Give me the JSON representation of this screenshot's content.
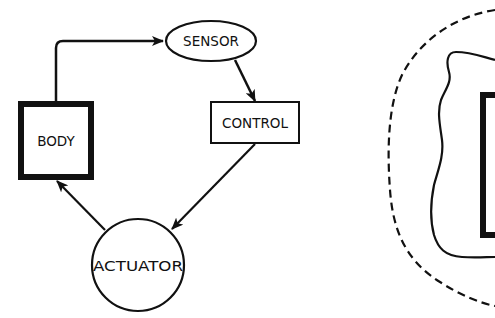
{
  "diagram": {
    "type": "feedback-loop",
    "colors": {
      "stroke": "#111111",
      "background": "#ffffff"
    },
    "nodes": {
      "sensor": {
        "label": "SENSOR",
        "shape": "ellipse"
      },
      "control": {
        "label": "CONTROL",
        "shape": "rectangle"
      },
      "actuator": {
        "label": "ACTUATOR",
        "shape": "circle"
      },
      "body": {
        "label": "BODY",
        "shape": "thick-rectangle"
      }
    },
    "edges": [
      {
        "from": "body",
        "to": "sensor"
      },
      {
        "from": "sensor",
        "to": "control"
      },
      {
        "from": "control",
        "to": "actuator"
      },
      {
        "from": "actuator",
        "to": "body"
      }
    ],
    "right_figure": {
      "elements": [
        "dashed-outer-boundary",
        "wavy-inner-boundary",
        "thick-rectangle-partial"
      ]
    }
  }
}
